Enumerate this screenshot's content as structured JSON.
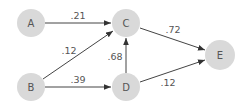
{
  "diagram": {
    "type": "directed-weighted-graph",
    "nodes": [
      {
        "id": "A",
        "label": "A",
        "x": 31,
        "y": 23
      },
      {
        "id": "B",
        "label": "B",
        "x": 31,
        "y": 87
      },
      {
        "id": "C",
        "label": "C",
        "x": 126,
        "y": 23
      },
      {
        "id": "D",
        "label": "D",
        "x": 126,
        "y": 87
      },
      {
        "id": "E",
        "label": "E",
        "x": 220,
        "y": 55
      }
    ],
    "edges": [
      {
        "from": "A",
        "to": "C",
        "weight": ".21"
      },
      {
        "from": "B",
        "to": "C",
        "weight": ".12"
      },
      {
        "from": "B",
        "to": "D",
        "weight": ".39"
      },
      {
        "from": "D",
        "to": "C",
        "weight": ".68"
      },
      {
        "from": "C",
        "to": "E",
        "weight": ".72"
      },
      {
        "from": "D",
        "to": "E",
        "weight": ".12"
      }
    ],
    "colors": {
      "node_fill": "#d9d9d9",
      "edge": "#444444",
      "text": "#555555"
    }
  }
}
